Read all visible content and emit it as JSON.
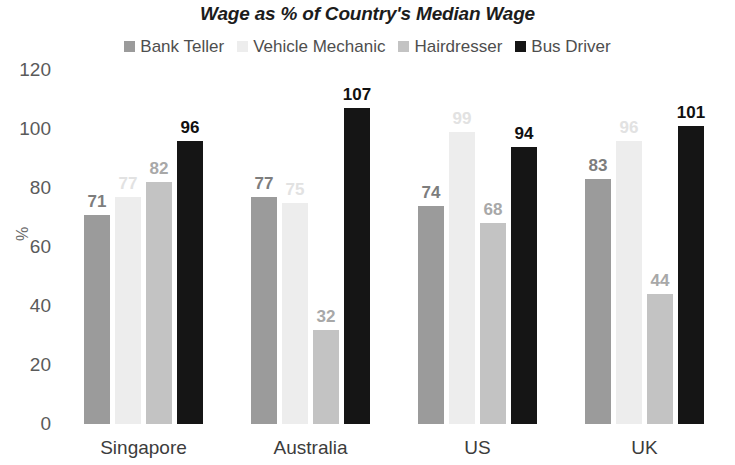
{
  "chart_data": {
    "type": "bar",
    "title": "Wage as % of Country's Median Wage",
    "xlabel": "",
    "ylabel": "%",
    "ylim": [
      0,
      120
    ],
    "yticks": [
      120,
      100,
      80,
      60,
      40,
      20,
      0
    ],
    "grid": false,
    "legend_position": "top-center",
    "categories": [
      "Singapore",
      "Australia",
      "US",
      "UK"
    ],
    "series": [
      {
        "name": "Bank Teller",
        "color": "#9b9b9b",
        "label_color": "#7d7d7d",
        "values": [
          71,
          77,
          74,
          83
        ]
      },
      {
        "name": "Vehicle Mechanic",
        "color": "#ededed",
        "label_color": "#e2e2e2",
        "values": [
          77,
          75,
          99,
          96
        ]
      },
      {
        "name": "Hairdresser",
        "color": "#c3c3c3",
        "label_color": "#a8a8a8",
        "values": [
          82,
          32,
          68,
          44
        ]
      },
      {
        "name": "Bus Driver",
        "color": "#151515",
        "label_color": "#101010",
        "values": [
          96,
          107,
          94,
          101
        ]
      }
    ]
  }
}
